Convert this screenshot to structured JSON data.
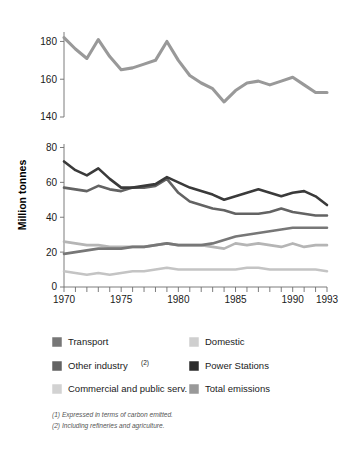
{
  "chart_data": {
    "type": "line",
    "title": "",
    "xlabel": "",
    "ylabel": "Million tonnes",
    "x": [
      1970,
      1971,
      1972,
      1973,
      1974,
      1975,
      1976,
      1977,
      1978,
      1979,
      1980,
      1981,
      1982,
      1983,
      1984,
      1985,
      1986,
      1987,
      1988,
      1989,
      1990,
      1991,
      1992,
      1993
    ],
    "xlim": [
      1970,
      1993
    ],
    "xticklabels": [
      "1970",
      "1975",
      "1980",
      "1985",
      "1990",
      "1993"
    ],
    "xticklabel_values": [
      1970,
      1975,
      1980,
      1985,
      1990,
      1993
    ],
    "grid": false,
    "legend_position": "below-plot",
    "broken_axis": true,
    "upper_panel": {
      "ylim": [
        140,
        185
      ],
      "yticks": [
        140,
        160,
        180
      ],
      "yticklabels": [
        "140",
        "160",
        "180"
      ]
    },
    "lower_panel": {
      "ylim": [
        0,
        82
      ],
      "yticks": [
        0,
        20,
        40,
        60,
        80
      ],
      "yticklabels": [
        "0",
        "20",
        "40",
        "60",
        "80"
      ]
    },
    "series": [
      {
        "name": "Total emissions",
        "panel": "upper",
        "color": "#999999",
        "stroke_width": 3.1,
        "values": [
          182,
          176,
          171,
          181,
          172,
          165,
          166,
          168,
          170,
          180,
          170,
          162,
          158,
          155,
          148,
          154,
          158,
          159,
          157,
          159,
          161,
          157,
          153,
          153
        ]
      },
      {
        "name": "Power Stations",
        "panel": "lower",
        "color": "#3a3a3a",
        "stroke_width": 2.6,
        "values": [
          72,
          67,
          64,
          68,
          62,
          57,
          57,
          58,
          59,
          63,
          60,
          57,
          55,
          53,
          50,
          52,
          54,
          56,
          54,
          52,
          54,
          55,
          52,
          47
        ]
      },
      {
        "name": "Other industry (2)",
        "panel": "lower",
        "color": "#636363",
        "stroke_width": 2.6,
        "values": [
          57,
          56,
          55,
          58,
          56,
          55,
          57,
          57,
          58,
          62,
          54,
          49,
          47,
          45,
          44,
          42,
          42,
          42,
          43,
          45,
          43,
          42,
          41,
          41
        ]
      },
      {
        "name": "Transport",
        "panel": "lower",
        "color": "#777777",
        "stroke_width": 2.6,
        "values": [
          19,
          20,
          21,
          22,
          22,
          22,
          23,
          23,
          24,
          25,
          24,
          24,
          24,
          25,
          27,
          29,
          30,
          31,
          32,
          33,
          34,
          34,
          34,
          34
        ]
      },
      {
        "name": "Commercial and public serv.",
        "panel": "lower",
        "color": "#b5b5b5",
        "stroke_width": 2.6,
        "values": [
          26,
          25,
          24,
          24,
          23,
          23,
          23,
          23,
          24,
          25,
          24,
          24,
          24,
          23,
          22,
          25,
          24,
          25,
          24,
          23,
          25,
          23,
          24,
          24
        ]
      },
      {
        "name": "Domestic",
        "panel": "lower",
        "color": "#c4c4c4",
        "stroke_width": 2.6,
        "values": [
          9,
          8,
          7,
          8,
          7,
          8,
          9,
          9,
          10,
          11,
          10,
          10,
          10,
          10,
          10,
          10,
          11,
          11,
          10,
          10,
          10,
          10,
          10,
          9
        ]
      }
    ]
  },
  "axis": {
    "ylabel": "Million tonnes",
    "upper_ticks": [
      "180",
      "160",
      "140"
    ],
    "lower_ticks": [
      "80",
      "60",
      "40",
      "20",
      "0"
    ],
    "x_ticks": [
      "1970",
      "1975",
      "1980",
      "1985",
      "1990",
      "1993"
    ]
  },
  "legend": {
    "items": [
      {
        "label": "Transport",
        "sup": "",
        "color": "#777777",
        "column": "left"
      },
      {
        "label": "Other industry",
        "sup": "(2)",
        "color": "#636363",
        "column": "left"
      },
      {
        "label": "Commercial and public serv.",
        "sup": "",
        "color": "#d2d2d2",
        "column": "left"
      },
      {
        "label": "Domestic",
        "sup": "",
        "color": "#cfcfcf",
        "column": "right"
      },
      {
        "label": "Power Stations",
        "sup": "",
        "color": "#2b2b2b",
        "column": "right"
      },
      {
        "label": "Total emissions",
        "sup": "",
        "color": "#999999",
        "column": "right"
      }
    ]
  },
  "footnotes": [
    "(1) Expressed in terms of carbon emitted.",
    "(2) Including refineries and agriculture."
  ]
}
